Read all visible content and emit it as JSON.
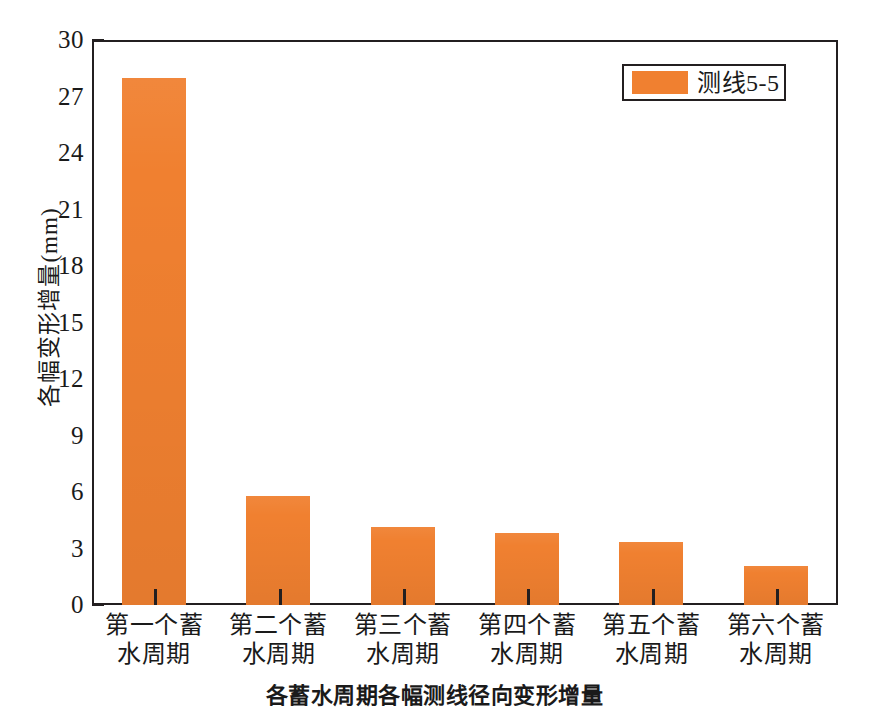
{
  "chart_data": {
    "type": "bar",
    "title": "",
    "xlabel": "",
    "ylabel": "各幅变形增量(mm)",
    "ylim": [
      0,
      30
    ],
    "ytick_step": 3,
    "yminor_step": 1.5,
    "grid": false,
    "legend_position": "top-right",
    "bar_color": "#f08030",
    "axis_color": "#231f20",
    "categories": [
      "第一个蓄水周期",
      "第二个蓄水周期",
      "第三个蓄水周期",
      "第四个蓄水周期",
      "第五个蓄水周期",
      "第六个蓄水周期"
    ],
    "category_lines": [
      [
        "第一个蓄",
        "水周期"
      ],
      [
        "第二个蓄",
        "水周期"
      ],
      [
        "第三个蓄",
        "水周期"
      ],
      [
        "第四个蓄",
        "水周期"
      ],
      [
        "第五个蓄",
        "水周期"
      ],
      [
        "第六个蓄",
        "水周期"
      ]
    ],
    "series": [
      {
        "name": "测线5-5",
        "values": [
          28.0,
          5.8,
          4.15,
          3.8,
          3.35,
          2.05
        ]
      }
    ],
    "ytick_labels": [
      "0",
      "3",
      "6",
      "9",
      "12",
      "15",
      "18",
      "21",
      "24",
      "27",
      "30"
    ],
    "ytick_values": [
      0,
      3,
      6,
      9,
      12,
      15,
      18,
      21,
      24,
      27,
      30
    ]
  },
  "legend": {
    "entries": [
      {
        "label": "测线5-5",
        "color": "#f08030"
      }
    ]
  },
  "caption": {
    "text": "各蓄水周期各幅测线径向变形增量"
  }
}
